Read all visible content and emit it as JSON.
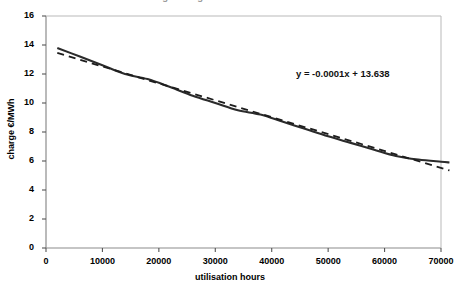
{
  "chart_data": {
    "type": "line",
    "title": "average charge versus utilisation hours",
    "xlabel": "utilisation hours",
    "ylabel": "charge €/MWh",
    "xlim": [
      0,
      70000
    ],
    "ylim": [
      0,
      16
    ],
    "xticks": [
      0,
      10000,
      20000,
      30000,
      40000,
      50000,
      60000,
      70000
    ],
    "xtick_labels": [
      "0",
      "10000",
      "20000",
      "30000",
      "40000",
      "50000",
      "60000",
      "70000"
    ],
    "yticks": [
      0,
      2,
      4,
      6,
      8,
      10,
      12,
      14,
      16
    ],
    "ytick_labels": [
      "0",
      "2",
      "4",
      "6",
      "8",
      "10",
      "12",
      "14",
      "16"
    ],
    "grid": false,
    "legend": null,
    "annotations": [
      {
        "name": "trendline-equation",
        "text": "y = -0.0001x + 13.638",
        "x": 47000,
        "y": 11.7
      }
    ],
    "series": [
      {
        "name": "charge curve",
        "style": "solid",
        "color": "#2b2b2b",
        "width": 2.1,
        "x": [
          2000,
          6000,
          10000,
          14000,
          18000,
          22000,
          26000,
          30000,
          34000,
          38000,
          42000,
          46000,
          50000,
          54000,
          58000,
          62000,
          66000,
          70000,
          71500
        ],
        "y": [
          13.8,
          13.2,
          12.6,
          12.0,
          11.65,
          11.1,
          10.5,
          10.0,
          9.5,
          9.2,
          8.7,
          8.2,
          7.7,
          7.25,
          6.8,
          6.35,
          6.1,
          5.95,
          5.9
        ]
      },
      {
        "name": "linear trendline",
        "style": "dashed",
        "color": "#1d1d1d",
        "width": 1.8,
        "x": [
          2000,
          71500
        ],
        "y": [
          13.45,
          5.35
        ]
      }
    ]
  },
  "axes": {
    "frame_color": "#8c8c8c",
    "tick_color": "#555555"
  }
}
